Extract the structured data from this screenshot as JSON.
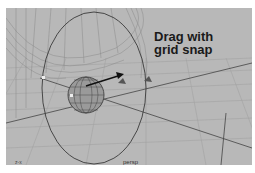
{
  "viewport": {
    "camera_label": "persp",
    "axis_indicator": "z-x",
    "background": "#b8b8b8"
  },
  "annotation": {
    "line1": "Drag with",
    "line2": "grid snap"
  },
  "scene": {
    "objects": [
      "wireframe-sphere",
      "wireframe-surface",
      "rotate-ring",
      "move-arrow"
    ]
  }
}
